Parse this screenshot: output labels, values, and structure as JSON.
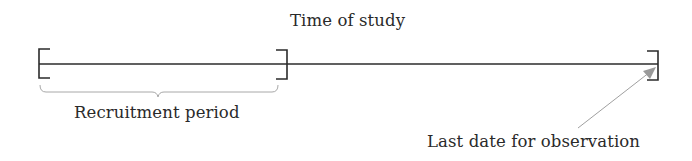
{
  "diagram": {
    "title": "Time of study",
    "labels": {
      "recruitment": "Recruitment period",
      "last_observation": "Last date for observation"
    },
    "timeline": {
      "start_x": 38,
      "end_x": 658,
      "y": 64,
      "recruitment_end_x": 287
    },
    "colors": {
      "line": "#2b2b2b",
      "brace": "#a8a8a8",
      "arrow": "#9a9a9a",
      "text": "#2a2a2a",
      "background": "#ffffff"
    }
  }
}
